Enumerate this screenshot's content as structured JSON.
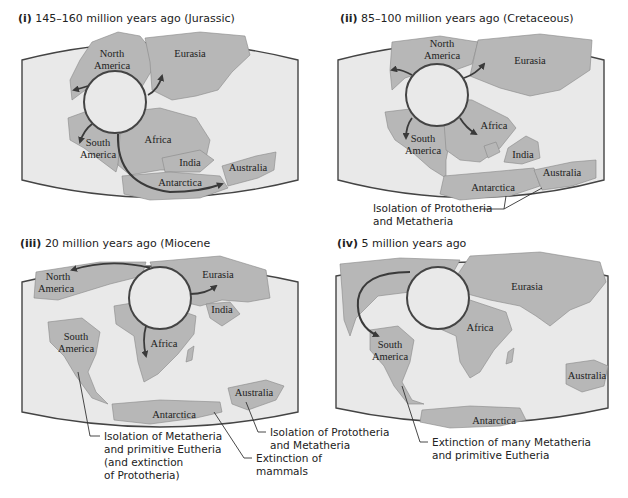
{
  "panels": [
    {
      "id": "i",
      "numeral": "(i)",
      "title": "145–160 million years ago (Jurassic)",
      "labels": {
        "north_america": [
          "North",
          "America"
        ],
        "eurasia": "Eurasia",
        "south_america": [
          "South",
          "America"
        ],
        "africa": "Africa",
        "india": "India",
        "antarctica": "Antarctica",
        "australia": "Australia"
      }
    },
    {
      "id": "ii",
      "numeral": "(ii)",
      "title": "85–100 million years ago (Cretaceous)",
      "labels": {
        "north_america": [
          "North",
          "America"
        ],
        "eurasia": "Eurasia",
        "south_america": [
          "South",
          "America"
        ],
        "africa": "Africa",
        "india": "India",
        "antarctica": "Antarctica",
        "australia": "Australia"
      },
      "notes": [
        {
          "lines": [
            "Isolation of Prototheria",
            "and Metatheria"
          ]
        }
      ]
    },
    {
      "id": "iii",
      "numeral": "(iii)",
      "title": "20 million years ago (Miocene",
      "labels": {
        "north_america": [
          "North",
          "America"
        ],
        "eurasia": "Eurasia",
        "india": "India",
        "south_america": [
          "South",
          "America"
        ],
        "africa": "Africa",
        "antarctica": "Antarctica",
        "australia": "Australia"
      },
      "notes": [
        {
          "lines": [
            "Isolation of Metatheria",
            "and primitive Eutheria",
            "(and extinction",
            "of Prototheria)"
          ]
        },
        {
          "lines": [
            "Extinction of",
            "mammals"
          ]
        },
        {
          "lines": [
            "Isolation of Prototheria",
            "and Metatheria"
          ]
        }
      ]
    },
    {
      "id": "iv",
      "numeral": "(iv)",
      "title": "5 million years ago",
      "labels": {
        "eurasia": "Eurasia",
        "africa": "Africa",
        "south_america": [
          "South",
          "America"
        ],
        "australia": "Australia",
        "antarctica": "Antarctica"
      },
      "notes": [
        {
          "lines": [
            "Extinction of many Metatheria",
            "and primitive Eutheria"
          ]
        }
      ]
    }
  ],
  "colors": {
    "ocean": "#e9e9e9",
    "land": "#b7b7b7",
    "outline": "#444444",
    "arrow": "#3a3a3a"
  }
}
